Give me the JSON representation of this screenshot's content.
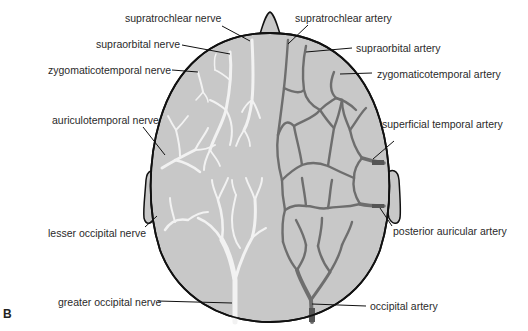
{
  "figure": {
    "panel_letter": "B",
    "colors": {
      "scalp_fill": "#c8c8c8",
      "outline": "#111111",
      "nerve": "#f2f2f2",
      "artery": "#6e6e6e",
      "leader_line": "#111111",
      "label_text": "#2a2a2a"
    },
    "nerve_labels": [
      {
        "text": "supratrochlear nerve"
      },
      {
        "text": "supraorbital nerve"
      },
      {
        "text": "zygomaticotemporal nerve"
      },
      {
        "text": "auriculotemporal nerve"
      },
      {
        "text": "lesser occipital nerve"
      },
      {
        "text": "greater occipital nerve"
      }
    ],
    "artery_labels": [
      {
        "text": "supratrochlear artery"
      },
      {
        "text": "supraorbital artery"
      },
      {
        "text": "zygomaticotemporal artery"
      },
      {
        "text": "superficial temporal artery"
      },
      {
        "text": "posterior auricular artery"
      },
      {
        "text": "occipital artery"
      }
    ]
  }
}
